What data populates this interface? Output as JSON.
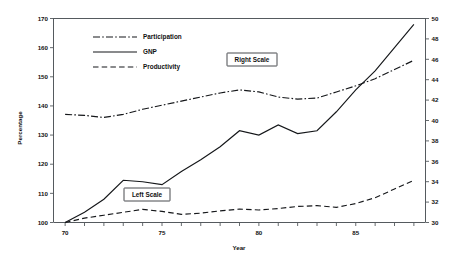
{
  "chart_data": {
    "type": "line",
    "title": "",
    "xlabel": "Year",
    "ylabel": "Percentage",
    "grid": false,
    "legend_position": "upper-left-inside",
    "x": [
      70,
      71,
      72,
      73,
      74,
      75,
      76,
      77,
      78,
      79,
      80,
      81,
      82,
      83,
      84,
      85,
      86,
      87,
      88
    ],
    "xlim": [
      69.4,
      88.6
    ],
    "xticks": [
      70,
      71,
      72,
      73,
      74,
      75,
      76,
      77,
      78,
      79,
      80,
      81,
      82,
      83,
      84,
      85,
      86,
      87,
      88
    ],
    "xtick_labels_shown": [
      "70",
      "75",
      "80",
      "85"
    ],
    "xtick_labels_shown_at": [
      70,
      75,
      80,
      85
    ],
    "left_axis": {
      "label": "Percentage",
      "lim": [
        100,
        170
      ],
      "ticks": [
        100,
        110,
        120,
        130,
        140,
        150,
        160,
        170
      ],
      "tick_labels": [
        "100",
        "110",
        "120",
        "130",
        "140",
        "150",
        "160",
        "170"
      ]
    },
    "right_axis": {
      "lim": [
        30,
        50
      ],
      "ticks": [
        30,
        32,
        34,
        36,
        38,
        40,
        42,
        44,
        46,
        48,
        50
      ],
      "tick_labels": [
        "30",
        "32",
        "34",
        "36",
        "38",
        "40",
        "42",
        "44",
        "46",
        "48",
        "50"
      ]
    },
    "series": [
      {
        "name": "Participation",
        "label": "Participation",
        "axis": "right",
        "style": "dashdot",
        "color": "#15171a",
        "values": [
          40.6,
          40.5,
          40.3,
          40.6,
          41.1,
          41.5,
          41.9,
          42.3,
          42.7,
          43.0,
          42.8,
          42.3,
          42.1,
          42.2,
          42.8,
          43.4,
          44.1,
          45.0,
          45.9
        ]
      },
      {
        "name": "GNP",
        "label": "GNP",
        "axis": "left",
        "style": "solid",
        "color": "#15171a",
        "values": [
          100.0,
          103.5,
          108.0,
          114.5,
          114.0,
          113.0,
          117.5,
          121.5,
          126.0,
          131.5,
          130.0,
          133.5,
          130.5,
          131.5,
          138.0,
          145.5,
          152.0,
          160.0,
          168.0
        ]
      },
      {
        "name": "Productivity",
        "label": "Productivity",
        "axis": "left",
        "style": "dashed",
        "color": "#15171a",
        "values": [
          100.0,
          101.5,
          102.5,
          103.5,
          104.5,
          103.8,
          102.8,
          103.2,
          104.0,
          104.6,
          104.3,
          104.8,
          105.5,
          105.8,
          105.2,
          106.5,
          108.5,
          111.5,
          114.5
        ]
      }
    ],
    "annotations": [
      {
        "text": "Right Scale",
        "for": "Participation",
        "x": 79.2,
        "axis": "right",
        "value": 45.0
      },
      {
        "text": "Left Scale",
        "for": "GNP",
        "x": 74.3,
        "axis": "left",
        "value": 112.1
      }
    ],
    "legend_entries": [
      {
        "label": "Participation",
        "style": "dashdot"
      },
      {
        "label": "GNP",
        "style": "solid"
      },
      {
        "label": "Productivity",
        "style": "dashed"
      }
    ]
  }
}
